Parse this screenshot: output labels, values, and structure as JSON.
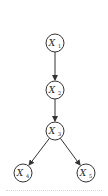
{
  "diagram": {
    "type": "directed-graph",
    "colors": {
      "stroke": "#333333",
      "background": "#ffffff"
    },
    "nodes": [
      {
        "id": "X1",
        "base": "X",
        "sub": "1",
        "cx": 55,
        "cy": 43
      },
      {
        "id": "X2",
        "base": "X",
        "sub": "2",
        "cx": 55,
        "cy": 90
      },
      {
        "id": "X3",
        "base": "X",
        "sub": "3",
        "cx": 55,
        "cy": 131
      },
      {
        "id": "X4",
        "base": "X",
        "sub": "4",
        "cx": 23,
        "cy": 173
      },
      {
        "id": "X5",
        "base": "X",
        "sub": "5",
        "cx": 86,
        "cy": 173
      }
    ],
    "edges": [
      {
        "from": "X1",
        "to": "X2"
      },
      {
        "from": "X2",
        "to": "X3"
      },
      {
        "from": "X3",
        "to": "X4"
      },
      {
        "from": "X3",
        "to": "X5"
      }
    ]
  }
}
